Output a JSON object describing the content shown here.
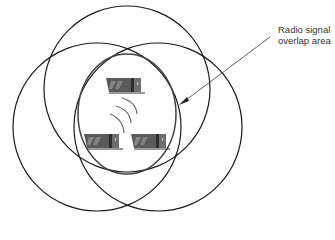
{
  "diagram": {
    "label": {
      "line1": "Radio signal",
      "line2": "overlap area"
    },
    "circles": [
      {
        "name": "top",
        "cx": 127,
        "cy": 89,
        "r": 83
      },
      {
        "name": "left",
        "cx": 97,
        "cy": 127,
        "r": 84
      },
      {
        "name": "right",
        "cx": 158,
        "cy": 127,
        "r": 84
      }
    ],
    "overlap": {
      "cx": 127,
      "cy": 114,
      "rx": 49,
      "ry": 60
    },
    "devices": [
      {
        "name": "laptop-top",
        "x": 106,
        "y": 78
      },
      {
        "name": "laptop-bottom-left",
        "x": 83,
        "y": 133
      },
      {
        "name": "laptop-bottom-right",
        "x": 130,
        "y": 133
      }
    ],
    "colors": {
      "stroke": "#1a1a1a",
      "overlap_stroke": "#444444",
      "device": "#555555"
    }
  }
}
